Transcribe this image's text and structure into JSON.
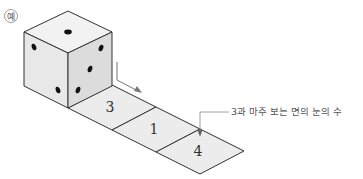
{
  "example_label": "예",
  "die": {
    "top_face_pips": 1,
    "left_face_pips": 2,
    "right_face_pips": 3
  },
  "tiles": [
    {
      "value": "3"
    },
    {
      "value": "1"
    },
    {
      "value": "4"
    }
  ],
  "annotation": "3과 마주 보는 면의 눈의 수",
  "colors": {
    "line": "#333333",
    "face_top": "#f2f2f2",
    "face_left": "#e8e8e8",
    "face_right": "#dcdcdc",
    "tile_fill": "#ececec",
    "arrow": "#777777"
  }
}
